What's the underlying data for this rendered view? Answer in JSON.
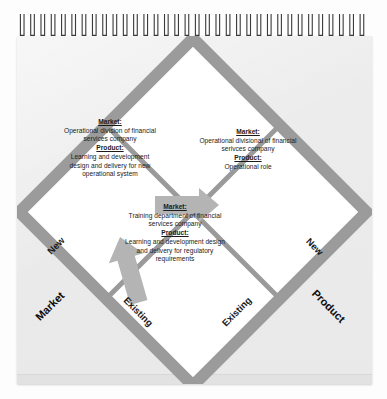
{
  "document": {
    "type": "notebook-page-diagram",
    "title": "Ansoff Matrix - Learning and Development Example",
    "binding_loop_count": 34
  },
  "colors": {
    "page_background": "#ffffff",
    "sheet": "#ededed",
    "band_gray": "#9b9b9b",
    "band_gray_dark": "#8f8f8f",
    "diamond_fill": "#ffffff",
    "divider_gray": "#9a9a9a",
    "arrow_gray": "#b0b0b0",
    "binding_wire": "#3a3a3a",
    "text": "#1b1b1b"
  },
  "diagram": {
    "shape": "diamond-quadrants",
    "quadrants": [
      {
        "id": "top",
        "position": "top",
        "empty": true,
        "entries": []
      },
      {
        "id": "left",
        "position": "left",
        "empty": false,
        "entries": [
          {
            "label": "Market:",
            "value": "Operational division of financial services company"
          },
          {
            "label": "Product:",
            "value": "Learning and development design and delivery for new operational system"
          }
        ]
      },
      {
        "id": "right",
        "position": "right",
        "empty": false,
        "entries": [
          {
            "label": "Market:",
            "value": "Operational divisional of financial serivces company"
          },
          {
            "label": "Product:",
            "value": "Operational role"
          }
        ]
      },
      {
        "id": "bottom",
        "position": "bottom",
        "empty": false,
        "entries": [
          {
            "label": "Market:",
            "value": "Training department of financial services company"
          },
          {
            "label": "Product:",
            "value": "Learning and development design and delivery for regulatory requirements"
          }
        ]
      }
    ],
    "axis_labels": [
      {
        "id": "market-new",
        "text": "New",
        "edge": "upper-left",
        "placement": "on-band"
      },
      {
        "id": "market-existing",
        "text": "Existing",
        "edge": "lower-left",
        "placement": "on-band"
      },
      {
        "id": "product-new",
        "text": "New",
        "edge": "upper-right",
        "placement": "on-band"
      },
      {
        "id": "product-existing",
        "text": "Existing",
        "edge": "lower-right",
        "placement": "on-band"
      },
      {
        "id": "axis-market",
        "text": "Market",
        "edge": "left",
        "placement": "outside"
      },
      {
        "id": "axis-product",
        "text": "Product",
        "edge": "right",
        "placement": "outside"
      }
    ],
    "arrows": [
      {
        "id": "arrow-left-to-right",
        "direction": "right",
        "from": "left-quadrant",
        "to": "right-quadrant"
      },
      {
        "id": "arrow-bottom-to-left",
        "direction": "up-left",
        "from": "bottom-quadrant",
        "to": "left-quadrant"
      }
    ]
  }
}
